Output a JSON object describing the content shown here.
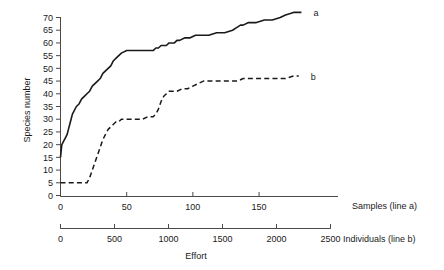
{
  "chart_data": {
    "type": "line",
    "title": "",
    "xlabel": "Effort",
    "ylabel": "Species number",
    "ylim": [
      0,
      70
    ],
    "yticks": [
      0,
      5,
      10,
      15,
      20,
      25,
      30,
      35,
      40,
      45,
      50,
      55,
      60,
      65,
      70
    ],
    "grid": false,
    "legend_position": "right-inline",
    "axes": [
      {
        "name": "samples-axis",
        "label": "Samples (line a)",
        "ticks": [
          0,
          50,
          100,
          150
        ],
        "range": [
          0,
          190
        ]
      },
      {
        "name": "individuals-axis",
        "label": "Individuals (line b)",
        "ticks": [
          0,
          500,
          1000,
          1500,
          2000,
          2500
        ],
        "range": [
          0,
          2500
        ]
      }
    ],
    "series": [
      {
        "name": "a",
        "label": "a",
        "style": "solid",
        "x_axis": "samples-axis",
        "x": [
          0,
          1,
          2,
          3,
          4,
          5,
          6,
          7,
          8,
          9,
          10,
          12,
          14,
          16,
          18,
          20,
          22,
          24,
          26,
          28,
          30,
          32,
          34,
          36,
          38,
          40,
          42,
          44,
          46,
          50,
          56,
          62,
          68,
          70,
          72,
          74,
          76,
          78,
          80,
          82,
          84,
          86,
          88,
          90,
          94,
          98,
          102,
          104,
          108,
          112,
          118,
          124,
          130,
          133,
          136,
          138,
          142,
          148,
          154,
          160,
          166,
          170,
          176,
          182
        ],
        "y": [
          15,
          20,
          21,
          22,
          23,
          24,
          26,
          28,
          30,
          32,
          33,
          35,
          36,
          38,
          39,
          40,
          41,
          43,
          44,
          45,
          46,
          48,
          49,
          50,
          51,
          53,
          54,
          55,
          56,
          57,
          57,
          57,
          57,
          57,
          58,
          58,
          59,
          59,
          59,
          60,
          60,
          60,
          61,
          61,
          62,
          62,
          63,
          63,
          63,
          63,
          64,
          64,
          65,
          66,
          67,
          67,
          68,
          68,
          69,
          69,
          70,
          71,
          72,
          72
        ]
      },
      {
        "name": "b",
        "label": "b",
        "style": "dashed",
        "x_axis": "samples-axis",
        "x": [
          0,
          6,
          12,
          18,
          20,
          22,
          24,
          26,
          28,
          30,
          32,
          34,
          36,
          38,
          40,
          42,
          44,
          46,
          50,
          56,
          62,
          66,
          70,
          72,
          74,
          76,
          78,
          80,
          82,
          84,
          86,
          88,
          92,
          96,
          100,
          104,
          108,
          112,
          118,
          124,
          130,
          134,
          138,
          142,
          146,
          152,
          158,
          164,
          170,
          176,
          180
        ],
        "y": [
          5,
          5,
          5,
          5,
          5,
          7,
          10,
          13,
          16,
          19,
          22,
          24,
          26,
          27,
          28,
          29,
          29,
          30,
          30,
          30,
          30,
          31,
          31,
          32,
          34,
          37,
          39,
          40,
          41,
          41,
          41,
          41,
          42,
          42,
          43,
          44,
          45,
          45,
          45,
          45,
          45,
          45,
          46,
          46,
          46,
          46,
          46,
          46,
          46,
          47,
          47
        ]
      }
    ]
  },
  "labels": {
    "ylabel": "Species number",
    "xlabel": "Effort",
    "samples_axis_label": "Samples (line a)",
    "individuals_axis_label": "Individuals (line b)",
    "series_a_label": "a",
    "series_b_label": "b"
  }
}
